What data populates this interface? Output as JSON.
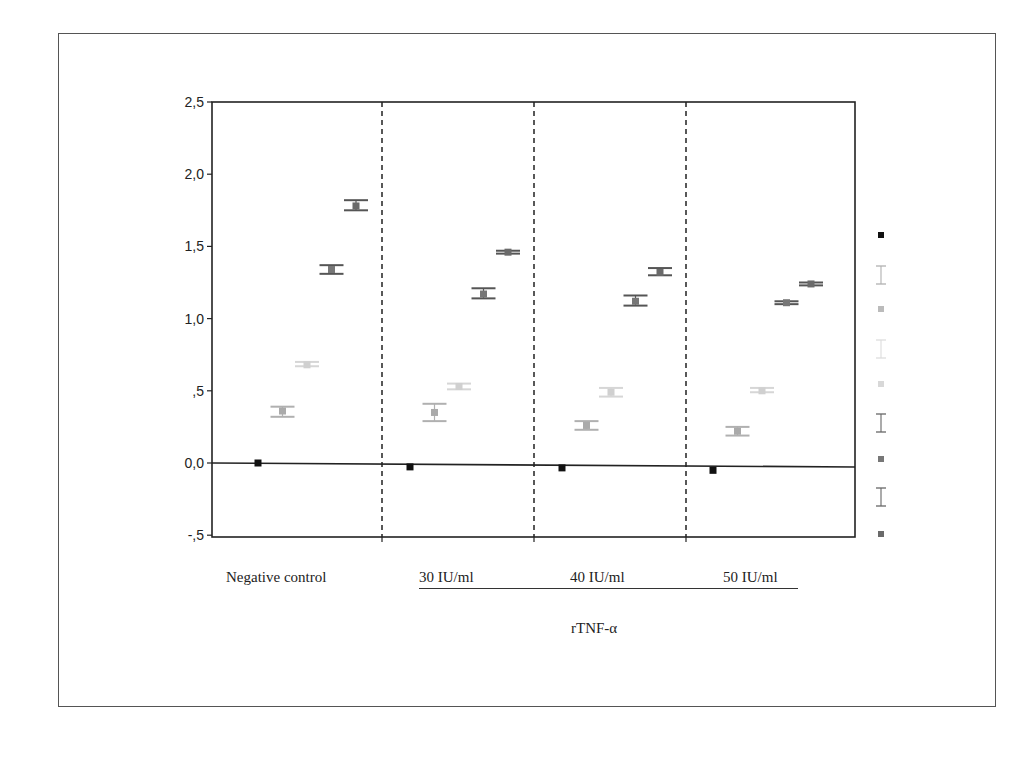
{
  "chart_data": {
    "type": "scatter",
    "title": "",
    "xlabel": "rTNF-α",
    "ylabel": "",
    "ylim": [
      -0.5,
      2.5
    ],
    "yticks": [
      "2,5",
      "2,0",
      "1,5",
      "1,0",
      ",5",
      "0,0",
      "-,5"
    ],
    "ytick_values": [
      2.5,
      2.0,
      1.5,
      1.0,
      0.5,
      0.0,
      -0.5
    ],
    "grid": false,
    "legend_position": "right",
    "legend_labels_visible": false,
    "categories": [
      "Negative control",
      "30 IU/ml",
      "40 IU/ml",
      "50 IU/ml"
    ],
    "group_label": "rTNF-α",
    "grouped_categories": [
      "30 IU/ml",
      "40 IU/ml",
      "50 IU/ml"
    ],
    "series": [
      {
        "name": "series-1",
        "color": "#111111",
        "values": [
          0.0,
          -0.02,
          -0.02,
          -0.03
        ],
        "err_low": [
          0.0,
          -0.02,
          -0.02,
          -0.03
        ],
        "err_high": [
          0.0,
          -0.02,
          -0.02,
          -0.03
        ]
      },
      {
        "name": "series-2",
        "color": "#aaaaaa",
        "values": [
          0.36,
          0.35,
          0.26,
          0.22
        ],
        "err_low": [
          0.32,
          0.29,
          0.23,
          0.19
        ],
        "err_high": [
          0.39,
          0.41,
          0.29,
          0.25
        ]
      },
      {
        "name": "series-3",
        "color": "#d0d0d0",
        "values": [
          0.68,
          0.53,
          0.49,
          0.5
        ],
        "err_low": [
          0.67,
          0.51,
          0.46,
          0.49
        ],
        "err_high": [
          0.7,
          0.55,
          0.52,
          0.52
        ]
      },
      {
        "name": "series-4",
        "color": "#777777",
        "values": [
          1.34,
          1.17,
          1.12,
          1.11
        ],
        "err_low": [
          1.31,
          1.14,
          1.09,
          1.1
        ],
        "err_high": [
          1.37,
          1.21,
          1.16,
          1.12
        ]
      },
      {
        "name": "series-5",
        "color": "#6a6a6a",
        "values": [
          1.78,
          1.46,
          1.32,
          1.24
        ],
        "err_low": [
          1.75,
          1.45,
          1.3,
          1.23
        ],
        "err_high": [
          1.82,
          1.47,
          1.35,
          1.25
        ]
      }
    ],
    "reference_line": {
      "y": 0.0,
      "style": "solid"
    },
    "separators": {
      "style": "dashed",
      "between": "categories"
    }
  },
  "labels": {
    "cat0": "Negative control",
    "cat1": "30 IU/ml",
    "cat2": "40 IU/ml",
    "cat3": "50 IU/ml",
    "group": "rTNF-α"
  }
}
